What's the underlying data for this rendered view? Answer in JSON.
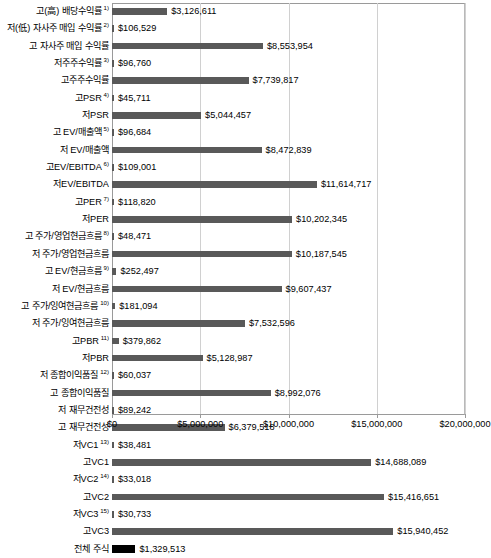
{
  "chart_data": {
    "type": "bar",
    "orientation": "horizontal",
    "title": "",
    "xlabel": "",
    "ylabel": "",
    "xlim": [
      0,
      20000000
    ],
    "grid": true,
    "legend": "none",
    "axis_ticks": [
      "$0",
      "$5,000,000",
      "$10,000,000",
      "$15,000,000",
      "$20,000,000"
    ],
    "axis_tick_values": [
      0,
      5000000,
      10000000,
      15000000,
      20000000
    ],
    "bar_color": "#595959",
    "highlight_color": "#000000",
    "categories": [
      "고(高) 배당수익률",
      "저(低) 자사주 매입 수익률",
      "고 자사주 매입 수익률",
      "저주주수익률",
      "고주주수익률",
      "고PSR",
      "저PSR",
      "고 EV/매출액",
      "저 EV/매출액",
      "고EV/EBITDA",
      "저EV/EBITDA",
      "고PER",
      "저PER",
      "고 주가/영업현금흐름",
      "저 주가/영업현금흐름",
      "고 EV/현금흐름",
      "저 EV/현금흐름",
      "고 주가/잉여현금흐름",
      "저 주가/잉여현금흐름",
      "고PBR",
      "저PBR",
      "저 종합이익품질",
      "고 종합이익품질",
      "저 재무건전성",
      "고 재무건전성",
      "저VC1",
      "고VC1",
      "저VC2",
      "고VC2",
      "저VC3",
      "고VC3",
      "전체 주식"
    ],
    "footnotes": [
      "1)",
      "2)",
      "",
      "3)",
      "",
      "4)",
      "",
      "5)",
      "",
      "6)",
      "",
      "7)",
      "",
      "8)",
      "",
      "9)",
      "",
      "10)",
      "",
      "11)",
      "",
      "12)",
      "",
      "",
      "",
      "13)",
      "",
      "14)",
      "",
      "15)",
      "",
      ""
    ],
    "values": [
      3126611,
      106529,
      8553954,
      96760,
      7739817,
      45711,
      5044457,
      96684,
      8472839,
      109001,
      11614717,
      118820,
      10202345,
      48471,
      10187545,
      252497,
      9607437,
      181094,
      7532596,
      379862,
      5128987,
      60037,
      8992076,
      89242,
      6379518,
      38481,
      14688089,
      33018,
      15416651,
      30733,
      15940452,
      1329513
    ],
    "value_labels": [
      "$3,126,611",
      "$106,529",
      "$8,553,954",
      "$96,760",
      "$7,739,817",
      "$45,711",
      "$5,044,457",
      "$96,684",
      "$8,472,839",
      "$109,001",
      "$11,614,717",
      "$118,820",
      "$10,202,345",
      "$48,471",
      "$10,187,545",
      "$252,497",
      "$9,607,437",
      "$181,094",
      "$7,532,596",
      "$379,862",
      "$5,128,987",
      "$60,037",
      "$8,992,076",
      "$89,242",
      "$6,379,518",
      "$38,481",
      "$14,688,089",
      "$33,018",
      "$15,416,651",
      "$30,733",
      "$15,940,452",
      "$1,329,513"
    ],
    "highlight_index": 31
  }
}
